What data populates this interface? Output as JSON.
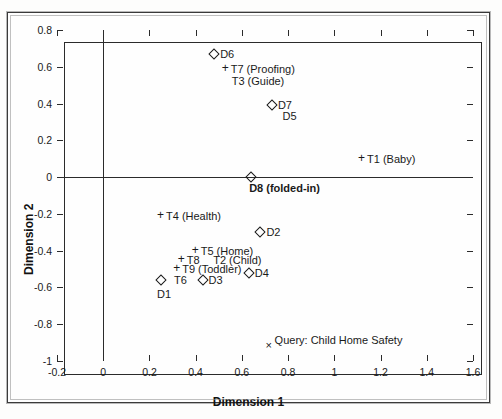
{
  "chart_data": {
    "type": "scatter",
    "title": "",
    "xlabel": "Dimension 1",
    "ylabel": "Dimension 2",
    "xlim": [
      -0.2,
      1.6
    ],
    "ylim": [
      -1,
      0.8
    ],
    "xticks": [
      "-0.2",
      "0",
      "0.2",
      "0.4",
      "0.6",
      "0.8",
      "1",
      "1.2",
      "1.4",
      "1.6"
    ],
    "yticks": [
      "0.8",
      "0.6",
      "0.4",
      "0.2",
      "0",
      "-0.2",
      "-0.4",
      "-0.6",
      "-0.8",
      "-1"
    ],
    "grid": false,
    "legend": "none",
    "axis_origin_lines": true,
    "markers": {
      "diamond": "documents",
      "plus": "terms",
      "x": "query"
    },
    "points": [
      {
        "id": "D6",
        "label": "D6",
        "marker": "diamond",
        "x": 0.48,
        "y": 0.67
      },
      {
        "id": "T7",
        "label": "T7 (Proofing)",
        "marker": "plus",
        "x": 0.53,
        "y": 0.59
      },
      {
        "id": "T3",
        "label": "T3 (Guide)",
        "marker": "none",
        "x": 0.53,
        "y": 0.52
      },
      {
        "id": "D7",
        "label": "D7",
        "marker": "diamond",
        "x": 0.73,
        "y": 0.39
      },
      {
        "id": "D5",
        "label": "D5",
        "marker": "none",
        "x": 0.75,
        "y": 0.33
      },
      {
        "id": "T1",
        "label": "T1 (Baby)",
        "marker": "plus",
        "x": 1.12,
        "y": 0.1
      },
      {
        "id": "D8",
        "label": "D8 (folded-in)",
        "marker": "diamond",
        "x": 0.64,
        "y": 0.0,
        "bold": true
      },
      {
        "id": "T4",
        "label": "T4 (Health)",
        "marker": "plus",
        "x": 0.25,
        "y": -0.21
      },
      {
        "id": "D2",
        "label": "D2",
        "marker": "diamond",
        "x": 0.68,
        "y": -0.3
      },
      {
        "id": "T5",
        "label": "T5 (Home)",
        "marker": "plus",
        "x": 0.4,
        "y": -0.4
      },
      {
        "id": "T8",
        "label": "T8",
        "marker": "plus",
        "x": 0.34,
        "y": -0.45
      },
      {
        "id": "T2",
        "label": "T2 (Child)",
        "marker": "none",
        "x": 0.45,
        "y": -0.45
      },
      {
        "id": "T9",
        "label": "T9 (Toddler)",
        "marker": "plus",
        "x": 0.32,
        "y": -0.5
      },
      {
        "id": "D4",
        "label": "D4",
        "marker": "diamond",
        "x": 0.63,
        "y": -0.52
      },
      {
        "id": "T6",
        "label": "T6",
        "marker": "none",
        "x": 0.28,
        "y": -0.56
      },
      {
        "id": "D3",
        "label": "D3",
        "marker": "diamond",
        "x": 0.43,
        "y": -0.56
      },
      {
        "id": "D1",
        "label": "D1",
        "marker": "diamond",
        "x": 0.25,
        "y": -0.56
      },
      {
        "id": "Q",
        "label": "Query: Child Home Safety",
        "marker": "x",
        "x": 0.72,
        "y": -0.92
      }
    ]
  }
}
